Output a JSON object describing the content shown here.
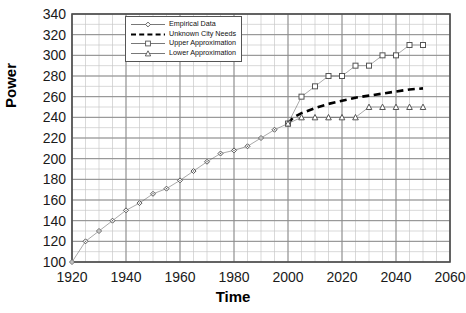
{
  "chart_data": {
    "type": "scatter",
    "title": "",
    "xlabel": "Time",
    "ylabel": "Power",
    "xlim": [
      1920,
      2060
    ],
    "ylim": [
      100,
      340
    ],
    "xticks": [
      1920,
      1940,
      1960,
      1980,
      2000,
      2020,
      2040,
      2060
    ],
    "yticks": [
      100,
      120,
      140,
      160,
      180,
      200,
      220,
      240,
      260,
      280,
      300,
      320,
      340
    ],
    "x_minor_step": 5,
    "y_minor_step": 10,
    "grid": true,
    "legend_position": "top-left-inside",
    "series": [
      {
        "name": "Empirical Data",
        "marker": "diamond",
        "line": "solid-thin",
        "color": "#555555",
        "points": [
          [
            1920,
            100
          ],
          [
            1925,
            120
          ],
          [
            1930,
            130
          ],
          [
            1935,
            140
          ],
          [
            1940,
            150
          ],
          [
            1945,
            157
          ],
          [
            1950,
            166
          ],
          [
            1955,
            171
          ],
          [
            1960,
            179
          ],
          [
            1965,
            188
          ],
          [
            1970,
            197
          ],
          [
            1975,
            205
          ],
          [
            1980,
            208
          ],
          [
            1985,
            212
          ],
          [
            1990,
            220
          ],
          [
            1995,
            228
          ],
          [
            2000,
            234
          ]
        ]
      },
      {
        "name": "Unknown City Needs",
        "marker": "none",
        "line": "dashed-thick",
        "color": "#000000",
        "points": [
          [
            2000,
            234
          ],
          [
            2002,
            240
          ],
          [
            2005,
            244
          ],
          [
            2010,
            249
          ],
          [
            2015,
            253
          ],
          [
            2020,
            256
          ],
          [
            2025,
            259
          ],
          [
            2030,
            261
          ],
          [
            2035,
            263
          ],
          [
            2040,
            265
          ],
          [
            2045,
            267
          ],
          [
            2050,
            268
          ]
        ]
      },
      {
        "name": "Upper Approximation",
        "marker": "square",
        "line": "solid-thin",
        "color": "#555555",
        "points": [
          [
            2000,
            234
          ],
          [
            2005,
            260
          ],
          [
            2010,
            270
          ],
          [
            2015,
            280
          ],
          [
            2020,
            280
          ],
          [
            2025,
            290
          ],
          [
            2030,
            290
          ],
          [
            2035,
            300
          ],
          [
            2040,
            300
          ],
          [
            2045,
            310
          ],
          [
            2050,
            310
          ]
        ]
      },
      {
        "name": "Lower Approximation",
        "marker": "triangle",
        "line": "solid-thin",
        "color": "#555555",
        "points": [
          [
            2000,
            234
          ],
          [
            2005,
            240
          ],
          [
            2010,
            240
          ],
          [
            2015,
            240
          ],
          [
            2020,
            240
          ],
          [
            2025,
            240
          ],
          [
            2030,
            250
          ],
          [
            2035,
            250
          ],
          [
            2040,
            250
          ],
          [
            2045,
            250
          ],
          [
            2050,
            250
          ]
        ]
      }
    ]
  },
  "legend": {
    "items": [
      {
        "label": "Empirical Data",
        "marker": "diamond",
        "line": "solid"
      },
      {
        "label": "Unknown City Needs",
        "marker": "none",
        "line": "dashed"
      },
      {
        "label": "Upper Approximation",
        "marker": "square",
        "line": "solid"
      },
      {
        "label": "Lower Approximation",
        "marker": "triangle",
        "line": "solid"
      }
    ]
  },
  "axes": {
    "x_title": "Time",
    "y_title": "Power",
    "x_tick_labels": [
      "1920",
      "1940",
      "1960",
      "1980",
      "2000",
      "2020",
      "2040",
      "2060"
    ],
    "y_tick_labels": [
      "340",
      "320",
      "300",
      "280",
      "260",
      "240",
      "220",
      "200",
      "180",
      "160",
      "140",
      "120",
      "100"
    ]
  },
  "colors": {
    "frame": "#4d4d4d",
    "major_grid": "#8c8c8c",
    "minor_grid": "#c8c8c8",
    "series": "#555555",
    "needs_line": "#000000",
    "text": "#1a1a1a"
  }
}
